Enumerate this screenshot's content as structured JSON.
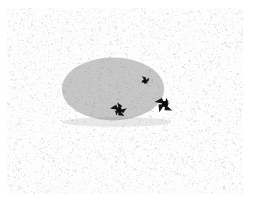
{
  "image": {
    "kind": "stipple-illustration",
    "subject_label": "hedgehog",
    "caption": "",
    "width_px": 258,
    "height_px": 210,
    "background_color": "#ffffff",
    "paper_color": "#fdfdfd",
    "noise_color": "#c9c9c9",
    "ink_color": "#3a3a3a",
    "dark_accent_color": "#111111",
    "margin_px": 8
  },
  "paper": {
    "left": 7,
    "top": 8,
    "width": 236,
    "height": 186,
    "texture": "fine random gray speckle",
    "speckle_count": 5200,
    "speckle_opacity_min": 0.06,
    "speckle_opacity_max": 0.42
  },
  "figure": {
    "name": "hedgehog",
    "body": {
      "center_x": 120,
      "center_y": 94,
      "left": 66,
      "right": 176,
      "top": 58,
      "bottom": 131,
      "width": 110,
      "height": 73,
      "fill": "#4a4a4a",
      "stroke_count": 2300,
      "stroke_color": "#2e2e2e"
    },
    "spines": {
      "label": "spiny-back-texture",
      "direction": "up-left diagonal quills",
      "density": 2300,
      "length_min": 2,
      "length_max": 6
    },
    "eye": {
      "label": "eye",
      "x": 152,
      "y": 89,
      "size": 6,
      "color": "#0c0c0c"
    },
    "snout": {
      "label": "snout-nose",
      "x": 172,
      "y": 112,
      "size": 9,
      "color": "#0c0c0c"
    },
    "front_foot": {
      "label": "front-foot",
      "x": 126,
      "y": 118,
      "size": 8,
      "color": "#0c0c0c"
    },
    "shadow": {
      "label": "ground-shadow",
      "x": 70,
      "y": 126,
      "width": 108,
      "height": 8,
      "opacity": 0.18
    }
  },
  "annotations": {
    "title": "",
    "has_text": false,
    "has_border": false
  }
}
